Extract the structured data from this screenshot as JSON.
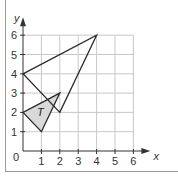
{
  "diagram": {
    "type": "coordinate-grid",
    "axes": {
      "x_label": "x",
      "y_label": "y",
      "origin_label": "0",
      "x_ticks": [
        "1",
        "2",
        "3",
        "4",
        "5",
        "6"
      ],
      "y_ticks": [
        "1",
        "2",
        "3",
        "4",
        "5",
        "6"
      ],
      "x_range": [
        0,
        6
      ],
      "y_range": [
        0,
        6
      ]
    },
    "shapes": [
      {
        "name": "T",
        "label": "T",
        "vertices": [
          [
            0,
            2
          ],
          [
            1,
            1
          ],
          [
            2,
            3
          ]
        ],
        "fill": "#d9d9d9",
        "stroke": "#2a2a2a"
      },
      {
        "name": "image",
        "label": "",
        "vertices": [
          [
            0,
            4
          ],
          [
            4,
            6
          ],
          [
            2,
            2
          ]
        ],
        "fill": "none",
        "stroke": "#2a2a2a"
      }
    ],
    "colors": {
      "grid": "#c8c8c8",
      "axis": "#333333",
      "frame": "#9a9a9a"
    }
  }
}
